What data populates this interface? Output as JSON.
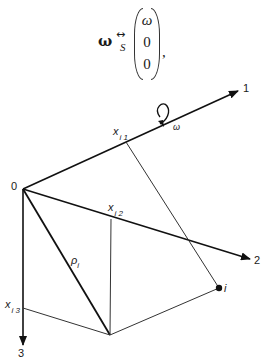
{
  "equation": {
    "lhs": "ω",
    "relation": "↔",
    "relation_subscript": "S",
    "vector": [
      "ω",
      "0",
      "0"
    ],
    "trailing": ","
  },
  "diagram": {
    "origin_label": "0",
    "axes": [
      {
        "id": "1",
        "label": "1"
      },
      {
        "id": "2",
        "label": "2"
      },
      {
        "id": "3",
        "label": "3"
      }
    ],
    "rotation_label": "ω",
    "point_label": "i",
    "vector_label": "ρ",
    "vector_label_sub": "i",
    "coord_labels": [
      {
        "main": "x",
        "sub": "i 1"
      },
      {
        "main": "x",
        "sub": "i 2"
      },
      {
        "main": "x",
        "sub": "i 3"
      }
    ]
  }
}
